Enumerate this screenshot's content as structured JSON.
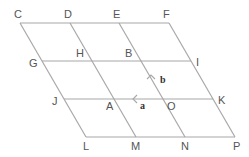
{
  "diagram": {
    "title": "",
    "grid": {
      "rows": 3,
      "cols": 3,
      "shape": "parallelogram"
    },
    "colors": {
      "line": "#a8a8a8",
      "label": "#555555",
      "vector_label": "#333333"
    },
    "points": [
      {
        "name": "C",
        "x": 20,
        "y": 23,
        "lx": 14,
        "ly": 18
      },
      {
        "name": "D",
        "x": 70,
        "y": 23,
        "lx": 64,
        "ly": 18
      },
      {
        "name": "E",
        "x": 119,
        "y": 23,
        "lx": 113,
        "ly": 18
      },
      {
        "name": "F",
        "x": 169,
        "y": 23,
        "lx": 163,
        "ly": 18
      },
      {
        "name": "G",
        "x": 42,
        "y": 61,
        "lx": 29,
        "ly": 67
      },
      {
        "name": "H",
        "x": 92,
        "y": 61,
        "lx": 76,
        "ly": 57
      },
      {
        "name": "B",
        "x": 141,
        "y": 61,
        "lx": 125,
        "ly": 57
      },
      {
        "name": "I",
        "x": 191,
        "y": 61,
        "lx": 196,
        "ly": 66
      },
      {
        "name": "J",
        "x": 64,
        "y": 99,
        "lx": 52,
        "ly": 105
      },
      {
        "name": "A",
        "x": 114,
        "y": 99,
        "lx": 106,
        "ly": 110
      },
      {
        "name": "O",
        "x": 163,
        "y": 99,
        "lx": 167,
        "ly": 110
      },
      {
        "name": "K",
        "x": 213,
        "y": 99,
        "lx": 218,
        "ly": 104
      },
      {
        "name": "L",
        "x": 86,
        "y": 137,
        "lx": 83,
        "ly": 150
      },
      {
        "name": "M",
        "x": 136,
        "y": 137,
        "lx": 131,
        "ly": 150
      },
      {
        "name": "N",
        "x": 185,
        "y": 137,
        "lx": 181,
        "ly": 150
      },
      {
        "name": "P",
        "x": 235,
        "y": 137,
        "lx": 233,
        "ly": 150
      }
    ],
    "vectors": [
      {
        "name": "a",
        "direction": "left",
        "on_line": "J-K",
        "label_x": 140,
        "label_y": 109
      },
      {
        "name": "b",
        "direction": "up-left",
        "on_line": "N-E",
        "label_x": 160,
        "label_y": 83
      }
    ]
  }
}
